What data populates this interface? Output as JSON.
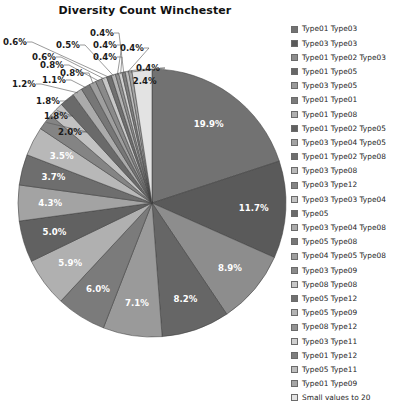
{
  "chart_data": {
    "type": "pie",
    "title": "Diversity Count Winchester",
    "xlabel": "",
    "ylabel": "",
    "legend_position": "right",
    "grid": false,
    "start_angle_deg": 0,
    "direction": "clockwise",
    "categories": [
      "Type01 Type03",
      "Type03 Type03",
      "Type01 Type02 Type03",
      "Type01 Type05",
      "Type03 Type05",
      "Type01 Type01",
      "Type01 Type08",
      "Type01 Type02 Type05",
      "Type03 Type04 Type05",
      "Type01 Type02 Type08",
      "Type03 Type08",
      "Type03 Type12",
      "Type03 Type03 Type04",
      "Type05",
      "Type03 Type04 Type08",
      "Type05 Type08",
      "Type04 Type05 Type08",
      "Type03 Type09",
      "Type08 Type08",
      "Type05 Type12",
      "Type05 Type09",
      "Type08 Type12",
      "Type03 Type11",
      "Type01 Type12",
      "Type05 Type11",
      "Type01 Type09",
      "Small values to 20"
    ],
    "values": [
      19.9,
      11.7,
      8.9,
      8.2,
      7.1,
      6.0,
      5.9,
      5.0,
      4.3,
      3.7,
      3.5,
      2.0,
      1.8,
      1.8,
      1.2,
      1.1,
      0.8,
      0.8,
      0.6,
      0.6,
      0.5,
      0.4,
      0.4,
      0.4,
      0.4,
      0.4,
      2.4
    ],
    "value_labels": [
      "19.9%",
      "11.7%",
      "8.9%",
      "8.2%",
      "7.1%",
      "6.0%",
      "5.9%",
      "5.0%",
      "4.3%",
      "3.7%",
      "3.5%",
      "2.0%",
      "1.8%",
      "1.8%",
      "1.2%",
      "1.1%",
      "0.8%",
      "0.8%",
      "0.6%",
      "0.6%",
      "0.5%",
      "0.4%",
      "0.4%",
      "0.4%",
      "0.4%",
      "0.4%",
      "2.4%"
    ],
    "colors": [
      "#727272",
      "#5a5a5a",
      "#8d8d8d",
      "#666666",
      "#9a9a9a",
      "#7b7b7b",
      "#b0b0b0",
      "#616161",
      "#a3a3a3",
      "#6e6e6e",
      "#b8b8b8",
      "#848484",
      "#c2c2c2",
      "#6a6a6a",
      "#ababab",
      "#777777",
      "#9f9f9f",
      "#8a8a8a",
      "#c8c8c8",
      "#707070",
      "#b4b4b4",
      "#939393",
      "#cfcfcf",
      "#7f7f7f",
      "#bdbdbd",
      "#a6a6a6",
      "#e3e3e3"
    ],
    "inside_label_count": 11,
    "units": "percent"
  },
  "legend": {
    "entries": [
      {
        "label": "Type01 Type03",
        "color": "#727272"
      },
      {
        "label": "Type03 Type03",
        "color": "#5a5a5a"
      },
      {
        "label": "Type01 Type02 Type03",
        "color": "#8d8d8d"
      },
      {
        "label": "Type01 Type05",
        "color": "#666666"
      },
      {
        "label": "Type03 Type05",
        "color": "#9a9a9a"
      },
      {
        "label": "Type01 Type01",
        "color": "#7b7b7b"
      },
      {
        "label": "Type01 Type08",
        "color": "#b0b0b0"
      },
      {
        "label": "Type01 Type02 Type05",
        "color": "#616161"
      },
      {
        "label": "Type03 Type04 Type05",
        "color": "#a3a3a3"
      },
      {
        "label": "Type01 Type02 Type08",
        "color": "#6e6e6e"
      },
      {
        "label": "Type03 Type08",
        "color": "#b8b8b8"
      },
      {
        "label": "Type03 Type12",
        "color": "#848484"
      },
      {
        "label": "Type03 Type03 Type04",
        "color": "#c2c2c2"
      },
      {
        "label": "Type05",
        "color": "#6a6a6a"
      },
      {
        "label": "Type03 Type04 Type08",
        "color": "#ababab"
      },
      {
        "label": "Type05 Type08",
        "color": "#777777"
      },
      {
        "label": "Type04 Type05 Type08",
        "color": "#9f9f9f"
      },
      {
        "label": "Type03 Type09",
        "color": "#8a8a8a"
      },
      {
        "label": "Type08 Type08",
        "color": "#c8c8c8"
      },
      {
        "label": "Type05 Type12",
        "color": "#707070"
      },
      {
        "label": "Type05 Type09",
        "color": "#b4b4b4"
      },
      {
        "label": "Type08 Type12",
        "color": "#939393"
      },
      {
        "label": "Type03 Type11",
        "color": "#cfcfcf"
      },
      {
        "label": "Type01 Type12",
        "color": "#7f7f7f"
      },
      {
        "label": "Type05 Type11",
        "color": "#bdbdbd"
      },
      {
        "label": "Type01 Type09",
        "color": "#a6a6a6"
      },
      {
        "label": "Small values to 20",
        "color": "#e3e3e3"
      }
    ]
  },
  "geometry": {
    "center_x": 152,
    "center_y": 203,
    "radius": 134
  },
  "callout_labels": [
    {
      "text": "2.0%",
      "x": 58,
      "y": 132
    },
    {
      "text": "1.8%",
      "x": 44,
      "y": 116
    },
    {
      "text": "1.8%",
      "x": 36,
      "y": 101
    },
    {
      "text": "1.2%",
      "x": 12,
      "y": 84
    },
    {
      "text": "1.1%",
      "x": 42,
      "y": 80
    },
    {
      "text": "0.8%",
      "x": 60,
      "y": 73
    },
    {
      "text": "0.8%",
      "x": 40,
      "y": 65
    },
    {
      "text": "0.6%",
      "x": 32,
      "y": 57
    },
    {
      "text": "0.6%",
      "x": 3,
      "y": 42
    },
    {
      "text": "0.5%",
      "x": 56,
      "y": 45
    },
    {
      "text": "0.4%",
      "x": 93,
      "y": 45
    },
    {
      "text": "0.4%",
      "x": 93,
      "y": 57
    },
    {
      "text": "0.4%",
      "x": 90,
      "y": 33
    },
    {
      "text": "0.4%",
      "x": 120,
      "y": 48
    },
    {
      "text": "0.4%",
      "x": 136,
      "y": 68
    }
  ]
}
